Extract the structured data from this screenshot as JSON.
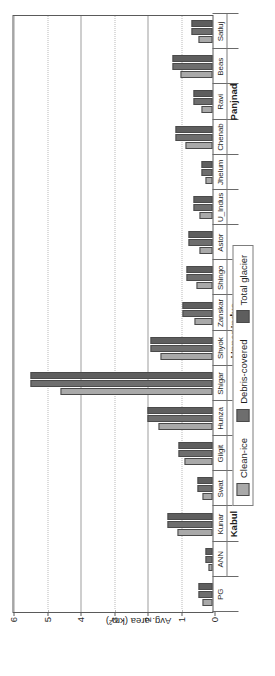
{
  "chart_data": {
    "type": "bar",
    "title": "",
    "xlabel": "",
    "ylabel": "Avg. area (km²)",
    "ylim": [
      0,
      6
    ],
    "yticks": [
      0,
      1,
      2,
      3,
      4,
      5,
      6
    ],
    "ytick_labels": [
      "0",
      "1",
      "2",
      "3",
      "4",
      "5",
      "6"
    ],
    "grid": true,
    "orientation": "vertical-bars-rotated-90",
    "legend_position": "below-axes",
    "categories": [
      "PG",
      "ANN",
      "Kunar",
      "Swat",
      "Gilgit",
      "Hunza",
      "Shigar",
      "Shyok",
      "Zanskar",
      "Shingo",
      "Astor",
      "U_Indus",
      "Jhelum",
      "Chenab",
      "Ravi",
      "Beas",
      "Satluj"
    ],
    "category_groups": [
      {
        "label": "Kabul",
        "members": [
          "ANN",
          "Kunar",
          "Swat"
        ]
      },
      {
        "label": "Upper Indus",
        "members": [
          "Gilgit",
          "Hunza",
          "Shigar",
          "Shyok",
          "Zanskar",
          "Shingo",
          "Astor",
          "U_Indus"
        ]
      },
      {
        "label": "Panjnad",
        "members": [
          "Jhelum",
          "Chenab",
          "Ravi",
          "Beas",
          "Satluj"
        ]
      }
    ],
    "series": [
      {
        "name": "Clean-ice",
        "color": "#a9a9a9",
        "values": [
          0.3,
          0.12,
          1.05,
          0.3,
          0.85,
          1.6,
          4.55,
          1.55,
          0.55,
          0.48,
          0.38,
          0.4,
          0.22,
          0.82,
          0.32,
          0.95,
          0.42
        ]
      },
      {
        "name": "Debris-covered",
        "color": "#6e6e6e",
        "values": [
          0.42,
          0.22,
          1.34,
          0.46,
          1.02,
          1.95,
          5.43,
          1.85,
          0.9,
          0.78,
          0.72,
          0.58,
          0.32,
          1.1,
          0.58,
          1.18,
          0.62
        ]
      },
      {
        "name": "Total glacier",
        "color": "#5e5e5e",
        "values": [
          0.42,
          0.22,
          1.34,
          0.46,
          1.02,
          1.95,
          5.43,
          1.85,
          0.9,
          0.78,
          0.72,
          0.58,
          0.32,
          1.1,
          0.58,
          1.18,
          0.62
        ]
      }
    ],
    "legend": [
      {
        "label": "Clean-ice",
        "color": "#a9a9a9"
      },
      {
        "label": "Debris-covered",
        "color": "#6e6e6e"
      },
      {
        "label": "Total glacier",
        "color": "#5e5e5e"
      }
    ]
  }
}
